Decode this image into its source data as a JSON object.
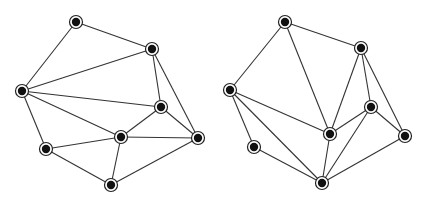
{
  "graphs": [
    {
      "name": "left-graph",
      "nodes": {
        "A": [
          76,
          22
        ],
        "B": [
          152,
          49
        ],
        "C": [
          22,
          91
        ],
        "D": [
          161,
          107
        ],
        "E": [
          121,
          137
        ],
        "F": [
          198,
          138
        ],
        "G": [
          46,
          149
        ],
        "H": [
          111,
          185
        ]
      },
      "edges": [
        [
          "A",
          "B"
        ],
        [
          "A",
          "C"
        ],
        [
          "B",
          "C"
        ],
        [
          "B",
          "D"
        ],
        [
          "B",
          "F"
        ],
        [
          "C",
          "D"
        ],
        [
          "C",
          "E"
        ],
        [
          "C",
          "G"
        ],
        [
          "D",
          "E"
        ],
        [
          "D",
          "F"
        ],
        [
          "E",
          "F"
        ],
        [
          "E",
          "G"
        ],
        [
          "E",
          "H"
        ],
        [
          "G",
          "H"
        ],
        [
          "H",
          "F"
        ]
      ]
    },
    {
      "name": "right-graph",
      "nodes": {
        "a": [
          285,
          22
        ],
        "b": [
          361,
          48
        ],
        "c": [
          230,
          90
        ],
        "d": [
          371,
          107
        ],
        "e": [
          330,
          134
        ],
        "f": [
          405,
          136
        ],
        "g": [
          254,
          147
        ],
        "h": [
          322,
          183
        ]
      },
      "edges": [
        [
          "a",
          "b"
        ],
        [
          "a",
          "c"
        ],
        [
          "a",
          "e"
        ],
        [
          "b",
          "e"
        ],
        [
          "b",
          "d"
        ],
        [
          "b",
          "f"
        ],
        [
          "c",
          "e"
        ],
        [
          "c",
          "g"
        ],
        [
          "c",
          "h"
        ],
        [
          "d",
          "e"
        ],
        [
          "d",
          "f"
        ],
        [
          "d",
          "h"
        ],
        [
          "e",
          "h"
        ],
        [
          "g",
          "h"
        ],
        [
          "h",
          "f"
        ]
      ]
    }
  ],
  "style": {
    "edge_color": "#333333",
    "node_fill": "#111111",
    "ring_color": "#222222"
  }
}
